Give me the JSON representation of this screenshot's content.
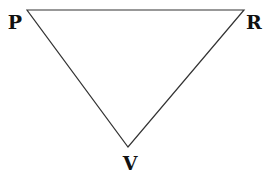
{
  "diagram": {
    "type": "triangle",
    "stroke_color": "#333333",
    "label_color": "#111111",
    "vertices": [
      {
        "label": "P",
        "x": 27,
        "y": 10,
        "label_x": 15,
        "label_y": 29
      },
      {
        "label": "R",
        "x": 244,
        "y": 10,
        "label_x": 254,
        "label_y": 29
      },
      {
        "label": "V",
        "x": 128,
        "y": 147,
        "label_x": 130,
        "label_y": 170
      }
    ],
    "edges": [
      {
        "from": "P",
        "to": "R"
      },
      {
        "from": "R",
        "to": "V"
      },
      {
        "from": "V",
        "to": "P"
      }
    ]
  }
}
